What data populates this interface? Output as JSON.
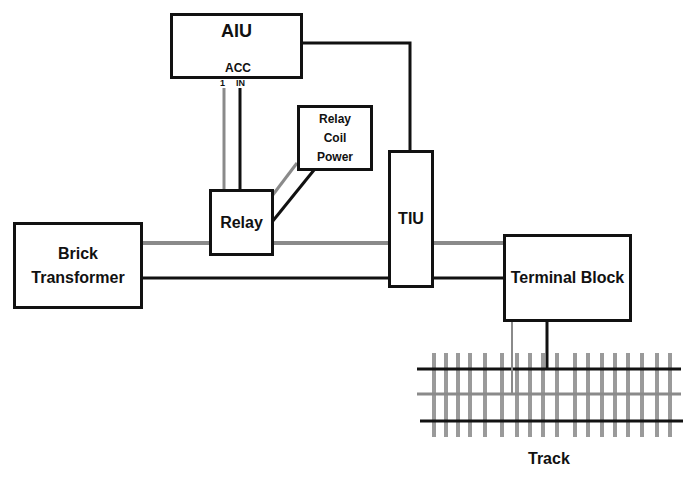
{
  "diagram": {
    "type": "wiring-diagram",
    "nodes": {
      "aiu": {
        "label": "AIU",
        "port_group": "ACC",
        "port_1": "1",
        "port_in": "IN"
      },
      "relay_coil_power": {
        "line1": "Relay",
        "line2": "Coil",
        "line3": "Power"
      },
      "relay": {
        "label": "Relay"
      },
      "tiu": {
        "label": "TIU"
      },
      "brick_transformer": {
        "line1": "Brick",
        "line2": "Transformer"
      },
      "terminal_block": {
        "label": "Terminal Block"
      },
      "track": {
        "label": "Track"
      }
    },
    "colors": {
      "wire_black": "#111111",
      "wire_gray": "#8a8a8a",
      "tie_gray": "#9a9a9a",
      "border": "#111111"
    },
    "edges": [
      {
        "from": "AIU ACC 1",
        "to": "Relay",
        "wire": "gray"
      },
      {
        "from": "AIU ACC IN",
        "to": "Relay",
        "wire": "black"
      },
      {
        "from": "Relay Coil Power",
        "to": "Relay",
        "wire": "gray"
      },
      {
        "from": "Relay Coil Power",
        "to": "Relay",
        "wire": "black"
      },
      {
        "from": "AIU",
        "to": "TIU",
        "wire": "black"
      },
      {
        "from": "Brick Transformer",
        "to": "Relay",
        "wire": "gray"
      },
      {
        "from": "Relay",
        "to": "TIU",
        "wire": "gray"
      },
      {
        "from": "Brick Transformer",
        "to": "TIU",
        "wire": "black"
      },
      {
        "from": "TIU",
        "to": "Terminal Block",
        "wire": "gray"
      },
      {
        "from": "TIU",
        "to": "Terminal Block",
        "wire": "black"
      },
      {
        "from": "Terminal Block",
        "to": "Track center rail",
        "wire": "gray"
      },
      {
        "from": "Terminal Block",
        "to": "Track outer rail",
        "wire": "black"
      }
    ]
  }
}
